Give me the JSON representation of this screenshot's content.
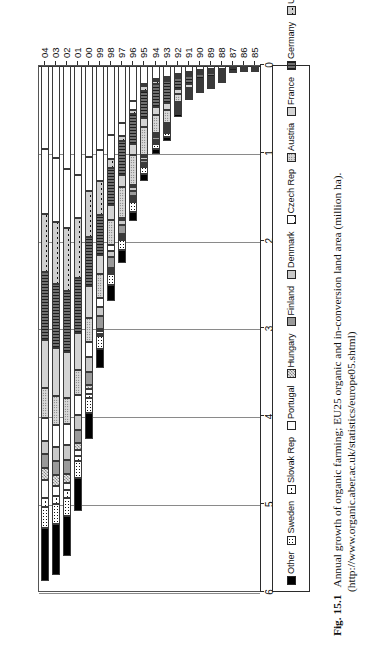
{
  "figure": {
    "number": "Fig. 15.1",
    "caption": "Annual growth of organic farming; EU25 organic and in-conversion land area (million ha).",
    "source_url": "(http://www.organic.aber.ac.uk/statistics/europe05.shtml)"
  },
  "legend": {
    "position": "top",
    "items": [
      {
        "label": "Other",
        "pattern": "solid-black",
        "color": "#000000"
      },
      {
        "label": "Sweden",
        "pattern": "dense-dots",
        "color": "#1a1a1a"
      },
      {
        "label": "Slovak Rep",
        "pattern": "x-hatch",
        "color": "#222222"
      },
      {
        "label": "Portugal",
        "pattern": "white",
        "color": "#fcfcfc"
      },
      {
        "label": "Hungary",
        "pattern": "fine-checker",
        "color": "#9a9a9a"
      },
      {
        "label": "Finland",
        "pattern": "gray-mid",
        "color": "#9a9a9a"
      },
      {
        "label": "Denmark",
        "pattern": "gray-light",
        "color": "#c9c9c9"
      },
      {
        "label": "Czech Rep",
        "pattern": "x-large",
        "color": "#1c1c1c"
      },
      {
        "label": "Austria",
        "pattern": "stipple",
        "color": "#d8d8d8"
      },
      {
        "label": "France",
        "pattern": "gray-pale",
        "color": "#d4d4d4"
      },
      {
        "label": "Germany",
        "pattern": "vertical-lines",
        "color": "#6f6f6f"
      },
      {
        "label": "U. Kingdom",
        "pattern": "x-dark",
        "color": "#cfcfcf"
      },
      {
        "label": "Spain",
        "pattern": "plain-white",
        "color": "#ffffff"
      },
      {
        "label": "Italy",
        "pattern": "plain-white",
        "color": "#ffffff"
      }
    ]
  },
  "chart_data": {
    "type": "bar",
    "orientation": "horizontal-stacked",
    "title": "",
    "xlabel": "",
    "ylabel": "million ha",
    "xlim": [
      0,
      6
    ],
    "xticks": [
      0,
      1,
      2,
      3,
      4,
      5,
      6
    ],
    "xtick_labels": [
      "0",
      "1",
      "2",
      "3",
      "4",
      "5",
      "6"
    ],
    "grid": true,
    "categories": [
      "85",
      "86",
      "87",
      "88",
      "89",
      "90",
      "91",
      "92",
      "93",
      "94",
      "95",
      "96",
      "97",
      "98",
      "99",
      "00",
      "01",
      "02",
      "03",
      "04"
    ],
    "series": [
      {
        "name": "Italy",
        "values": [
          0.01,
          0.02,
          0.02,
          0.03,
          0.04,
          0.05,
          0.07,
          0.09,
          0.12,
          0.15,
          0.2,
          0.4,
          0.65,
          0.79,
          0.96,
          1.04,
          1.24,
          1.17,
          1.05,
          0.95
        ]
      },
      {
        "name": "Spain",
        "values": [
          0.0,
          0.0,
          0.0,
          0.0,
          0.01,
          0.01,
          0.01,
          0.02,
          0.02,
          0.02,
          0.03,
          0.1,
          0.15,
          0.27,
          0.35,
          0.38,
          0.49,
          0.67,
          0.73,
          0.73
        ]
      },
      {
        "name": "U. Kingdom",
        "values": [
          0.0,
          0.0,
          0.0,
          0.01,
          0.01,
          0.01,
          0.02,
          0.02,
          0.03,
          0.03,
          0.05,
          0.05,
          0.05,
          0.1,
          0.39,
          0.53,
          0.68,
          0.72,
          0.7,
          0.67
        ]
      },
      {
        "name": "Germany",
        "values": [
          0.02,
          0.02,
          0.03,
          0.03,
          0.04,
          0.05,
          0.09,
          0.13,
          0.25,
          0.27,
          0.31,
          0.34,
          0.39,
          0.42,
          0.45,
          0.55,
          0.63,
          0.7,
          0.73,
          0.77
        ]
      },
      {
        "name": "France",
        "values": [
          0.01,
          0.01,
          0.01,
          0.02,
          0.02,
          0.03,
          0.04,
          0.05,
          0.08,
          0.09,
          0.1,
          0.12,
          0.14,
          0.17,
          0.22,
          0.37,
          0.42,
          0.52,
          0.55,
          0.55
        ]
      },
      {
        "name": "Austria",
        "values": [
          0.0,
          0.0,
          0.0,
          0.01,
          0.01,
          0.02,
          0.03,
          0.09,
          0.15,
          0.2,
          0.32,
          0.34,
          0.35,
          0.29,
          0.27,
          0.27,
          0.29,
          0.3,
          0.33,
          0.34
        ]
      },
      {
        "name": "Czech Rep",
        "values": [
          0.0,
          0.0,
          0.0,
          0.0,
          0.0,
          0.01,
          0.02,
          0.02,
          0.02,
          0.02,
          0.02,
          0.02,
          0.02,
          0.07,
          0.11,
          0.17,
          0.22,
          0.24,
          0.25,
          0.26
        ]
      },
      {
        "name": "Denmark",
        "values": [
          0.0,
          0.0,
          0.0,
          0.01,
          0.01,
          0.01,
          0.02,
          0.02,
          0.02,
          0.02,
          0.04,
          0.05,
          0.06,
          0.06,
          0.1,
          0.17,
          0.17,
          0.17,
          0.16,
          0.15
        ]
      },
      {
        "name": "Finland",
        "values": [
          0.0,
          0.0,
          0.0,
          0.01,
          0.01,
          0.01,
          0.01,
          0.02,
          0.02,
          0.03,
          0.03,
          0.06,
          0.1,
          0.13,
          0.14,
          0.15,
          0.15,
          0.16,
          0.16,
          0.16
        ]
      },
      {
        "name": "Hungary",
        "values": [
          0.0,
          0.0,
          0.0,
          0.0,
          0.0,
          0.0,
          0.0,
          0.01,
          0.01,
          0.01,
          0.01,
          0.02,
          0.02,
          0.02,
          0.03,
          0.05,
          0.08,
          0.1,
          0.12,
          0.13
        ]
      },
      {
        "name": "Portugal",
        "values": [
          0.0,
          0.0,
          0.0,
          0.0,
          0.0,
          0.0,
          0.0,
          0.01,
          0.01,
          0.01,
          0.01,
          0.01,
          0.01,
          0.02,
          0.03,
          0.05,
          0.07,
          0.08,
          0.12,
          0.21
        ]
      },
      {
        "name": "Slovak Rep",
        "values": [
          0.0,
          0.0,
          0.0,
          0.0,
          0.0,
          0.0,
          0.0,
          0.0,
          0.0,
          0.0,
          0.0,
          0.01,
          0.01,
          0.01,
          0.02,
          0.05,
          0.06,
          0.09,
          0.09,
          0.1
        ]
      },
      {
        "name": "Sweden",
        "values": [
          0.0,
          0.0,
          0.0,
          0.01,
          0.01,
          0.02,
          0.02,
          0.03,
          0.04,
          0.06,
          0.08,
          0.11,
          0.12,
          0.13,
          0.15,
          0.17,
          0.19,
          0.21,
          0.23,
          0.24
        ]
      },
      {
        "name": "Other",
        "values": [
          0.0,
          0.0,
          0.0,
          0.0,
          0.01,
          0.01,
          0.02,
          0.03,
          0.05,
          0.06,
          0.08,
          0.1,
          0.14,
          0.18,
          0.22,
          0.3,
          0.38,
          0.45,
          0.58,
          0.61
        ]
      }
    ],
    "totals": [
      0.04,
      0.05,
      0.06,
      0.13,
      0.17,
      0.23,
      0.35,
      0.54,
      0.82,
      0.97,
      1.28,
      1.73,
      2.21,
      2.66,
      3.44,
      4.25,
      5.07,
      5.58,
      5.8,
      5.87
    ]
  },
  "axes": {
    "value_ticks": [
      "6",
      "5",
      "4",
      "3",
      "2",
      "1",
      "0"
    ],
    "category_ticks": [
      "04",
      "03",
      "02",
      "01",
      "00",
      "99",
      "98",
      "97",
      "96",
      "95",
      "94",
      "93",
      "92",
      "91",
      "90",
      "89",
      "88",
      "87",
      "86",
      "85"
    ]
  }
}
